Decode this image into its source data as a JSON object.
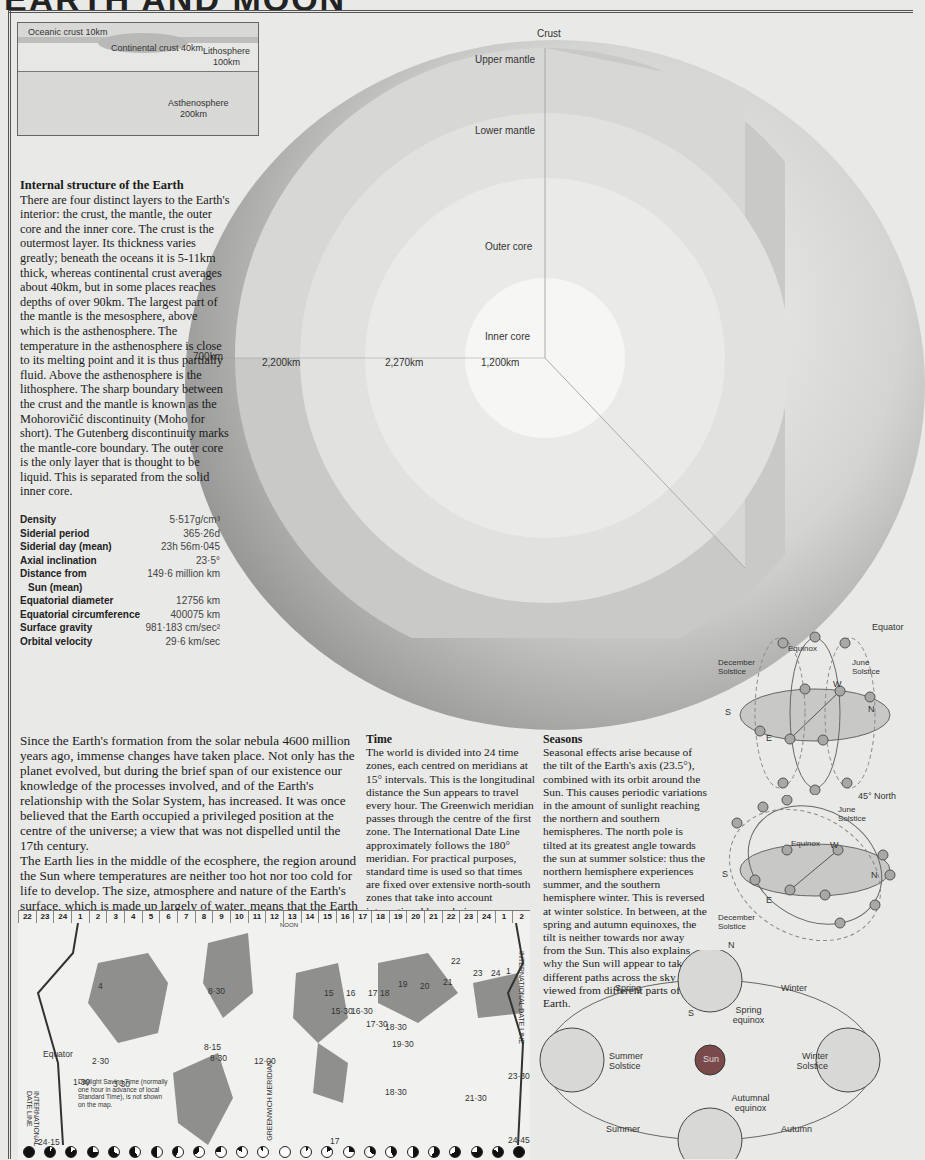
{
  "page": {
    "title": "EARTH AND MOON"
  },
  "inset": {
    "oceanic_crust": "Oceanic crust 10km",
    "continental_crust": "Continental crust  40km",
    "lithosphere": "Lithosphere",
    "lithosphere_depth": "100km",
    "asthenosphere": "Asthenosphere",
    "asthenosphere_depth": "200km"
  },
  "globe": {
    "layers": {
      "crust": "Crust",
      "upper_mantle": "Upper mantle",
      "lower_mantle": "Lower mantle",
      "outer_core": "Outer core",
      "inner_core": "Inner core"
    },
    "thickness": [
      "700km",
      "2,200km",
      "2,270km",
      "1,200km"
    ]
  },
  "internal_structure": {
    "heading": "Internal structure of the Earth",
    "text": "There are four distinct layers to the Earth's interior: the crust, the mantle, the outer core and the inner core. The crust is the outermost layer. Its thickness varies greatly; beneath the oceans it is 5-11km thick, whereas continental crust averages about 40km, but in some places reaches depths of over 90km. The largest part of the mantle is the mesosphere, above which is the asthenosphere. The temperature in the asthenosphere is close to its melting point and it is thus partially fluid. Above the asthenosphere is the lithosphere. The sharp boundary between the crust and the mantle is known as the Mohorovičić discontinuity (Moho for short). The Gutenberg discontinuity marks the mantle-core boundary. The outer core is the only layer that is thought to be liquid. This is separated from the solid inner core."
  },
  "stats": [
    {
      "label": "Density",
      "value": "5·517g/cm³"
    },
    {
      "label": "Siderial period",
      "value": "365·26d"
    },
    {
      "label": "Siderial day (mean)",
      "value": "23h 56m·045"
    },
    {
      "label": "Axial inclination",
      "value": "23·5°"
    },
    {
      "label": "Distance from",
      "value": "149·6 million km"
    },
    {
      "label": "  Sun (mean)",
      "value": ""
    },
    {
      "label": "Equatorial diameter",
      "value": "12756 km"
    },
    {
      "label": "Equatorial circumference",
      "value": "400075 km"
    },
    {
      "label": "Surface gravity",
      "value": "981·183 cm/sec²"
    },
    {
      "label": "Orbital velocity",
      "value": "29·6 km/sec"
    }
  ],
  "intro": {
    "p1": "Since the Earth's formation from the solar nebula 4600 million years ago, immense changes have taken place. Not only has the planet evolved, but during the brief span of our existence our knowledge of the processes involved, and of the Earth's relationship with the Solar System, has increased. It was once believed that the Earth occupied a privileged position at the centre of the universe; a view that was not dispelled until the 17th century.",
    "p2": "The Earth lies in the middle of the ecosphere, the region around the Sun where temperatures are neither too hot nor too cold for life to develop. The size, atmosphere and nature of the Earth's surface, which is made up largely of water, means that the Earth is the only known planet capable of supporting life."
  },
  "time": {
    "heading": "Time",
    "text": "The world is divided into 24 time zones, each centred on meridians at 15° intervals. This is the longitudinal distance the Sun appears to travel every hour. The Greenwich meridian passes through the centre of the first zone. The International Date Line approximately follows the 180° meridian. For practical purposes, standard time is used so that times are fixed over extensive north-south zones that take into account international boundaries."
  },
  "seasons": {
    "heading": "Seasons",
    "text": "Seasonal effects arise because of the tilt of the Earth's axis (23.5°), combined with its orbit around the Sun. This causes periodic variations in the amount of sunlight reaching the northern and southern hemispheres. The north pole is tilted at its greatest angle towards the sun at summer solstice: thus the northern hemisphere experiences summer, and the southern hemisphere winter. This is reversed at winter solstice. In between, at the spring and autumn equinoxes, the tilt is neither towards nor away from the Sun. This also explains why the Sun will appear to take different paths across the sky when viewed from different parts of the Earth."
  },
  "sky_diagrams": {
    "equator": {
      "title": "Equator",
      "equinox": "Equinox",
      "december": "December Solstice",
      "june": "June Solstice",
      "s": "S",
      "n": "N",
      "e": "E",
      "w": "W"
    },
    "north45": {
      "title": "45° North",
      "equinox": "Equinox",
      "december": "December Solstice",
      "june": "June Solstice",
      "s": "S",
      "n": "N",
      "e": "E",
      "w": "W"
    }
  },
  "orbit": {
    "sun": "Sun",
    "spring": "Spring",
    "winter": "Winter",
    "summer": "Summer",
    "autumn": "Autumn",
    "spring_equinox": "Spring equinox",
    "summer_solstice": "Summer Solstice",
    "winter_solstice": "Winter Solstice",
    "autumnal_equinox": "Autumnal equinox",
    "n": "N",
    "s": "S"
  },
  "timezone_map": {
    "zones": [
      "22",
      "23",
      "24",
      "1",
      "2",
      "3",
      "4",
      "5",
      "6",
      "7",
      "8",
      "9",
      "10",
      "11",
      "12",
      "13",
      "14",
      "15",
      "16",
      "17",
      "18",
      "19",
      "20",
      "21",
      "22",
      "23",
      "24",
      "1",
      "2"
    ],
    "noon": "NOON",
    "labels": [
      "4",
      "8·30",
      "15",
      "16",
      "17",
      "18",
      "19",
      "20",
      "21",
      "22",
      "23",
      "24",
      "1",
      "15·30",
      "16·30",
      "17·30",
      "18·30",
      "19·30",
      "8·15",
      "8·30",
      "12·00",
      "2·30",
      "1·30",
      "3·30",
      "18·30",
      "21·30",
      "23·30",
      "24·45",
      "24·15",
      "17"
    ],
    "equator": "Equator",
    "greenwich": "GREENWICH MERIDIAN",
    "date_line": "INTERNATIONAL DATE LINE",
    "note": "Daylight Saving Time (normally one hour in advance of local Standard Time), is not shown on the map."
  }
}
